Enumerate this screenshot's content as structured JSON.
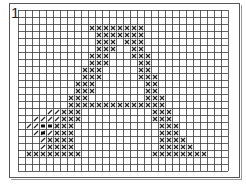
{
  "pattern": {
    "number_label": "1",
    "title": "Cross-stitch chart: letter A",
    "grid": {
      "cols": 30,
      "rows": 23,
      "cell": 7,
      "line_color": "#3a3a3a",
      "bg": "#ffffff"
    },
    "symbols": {
      "cross": {
        "name": "cross-stitch",
        "color": "#2a2a2a"
      },
      "slash": {
        "name": "half-stitch",
        "color": "#2a2a2a"
      },
      "dot": {
        "name": "french-knot",
        "color": "#111111"
      }
    },
    "crosses": [
      [
        2,
        10
      ],
      [
        2,
        11
      ],
      [
        2,
        12
      ],
      [
        2,
        13
      ],
      [
        2,
        14
      ],
      [
        2,
        15
      ],
      [
        2,
        16
      ],
      [
        2,
        17
      ],
      [
        3,
        11
      ],
      [
        3,
        12
      ],
      [
        3,
        13
      ],
      [
        3,
        14
      ],
      [
        3,
        15
      ],
      [
        3,
        16
      ],
      [
        3,
        17
      ],
      [
        4,
        11
      ],
      [
        4,
        12
      ],
      [
        4,
        13
      ],
      [
        4,
        15
      ],
      [
        4,
        16
      ],
      [
        4,
        17
      ],
      [
        5,
        11
      ],
      [
        5,
        12
      ],
      [
        5,
        13
      ],
      [
        5,
        16
      ],
      [
        5,
        17
      ],
      [
        6,
        10
      ],
      [
        6,
        11
      ],
      [
        6,
        12
      ],
      [
        6,
        16
      ],
      [
        6,
        17
      ],
      [
        6,
        18
      ],
      [
        7,
        10
      ],
      [
        7,
        11
      ],
      [
        7,
        12
      ],
      [
        7,
        17
      ],
      [
        7,
        18
      ],
      [
        8,
        9
      ],
      [
        8,
        10
      ],
      [
        8,
        11
      ],
      [
        8,
        17
      ],
      [
        8,
        18
      ],
      [
        9,
        9
      ],
      [
        9,
        10
      ],
      [
        9,
        11
      ],
      [
        9,
        17
      ],
      [
        9,
        18
      ],
      [
        9,
        19
      ],
      [
        10,
        8
      ],
      [
        10,
        9
      ],
      [
        10,
        10
      ],
      [
        10,
        18
      ],
      [
        10,
        19
      ],
      [
        11,
        8
      ],
      [
        11,
        9
      ],
      [
        11,
        10
      ],
      [
        11,
        18
      ],
      [
        11,
        19
      ],
      [
        12,
        7
      ],
      [
        12,
        8
      ],
      [
        12,
        9
      ],
      [
        12,
        18
      ],
      [
        12,
        19
      ],
      [
        12,
        20
      ],
      [
        13,
        7
      ],
      [
        13,
        8
      ],
      [
        13,
        9
      ],
      [
        13,
        10
      ],
      [
        13,
        11
      ],
      [
        13,
        12
      ],
      [
        13,
        13
      ],
      [
        13,
        14
      ],
      [
        13,
        15
      ],
      [
        13,
        16
      ],
      [
        13,
        17
      ],
      [
        13,
        18
      ],
      [
        13,
        19
      ],
      [
        13,
        20
      ],
      [
        14,
        6
      ],
      [
        14,
        7
      ],
      [
        14,
        8
      ],
      [
        14,
        19
      ],
      [
        14,
        20
      ],
      [
        14,
        21
      ],
      [
        15,
        6
      ],
      [
        15,
        7
      ],
      [
        15,
        8
      ],
      [
        15,
        19
      ],
      [
        15,
        20
      ],
      [
        15,
        21
      ],
      [
        16,
        5
      ],
      [
        16,
        6
      ],
      [
        16,
        7
      ],
      [
        16,
        20
      ],
      [
        16,
        21
      ],
      [
        16,
        22
      ],
      [
        17,
        5
      ],
      [
        17,
        6
      ],
      [
        17,
        7
      ],
      [
        17,
        20
      ],
      [
        17,
        21
      ],
      [
        17,
        22
      ],
      [
        18,
        4
      ],
      [
        18,
        5
      ],
      [
        18,
        6
      ],
      [
        18,
        7
      ],
      [
        18,
        20
      ],
      [
        18,
        21
      ],
      [
        18,
        22
      ],
      [
        18,
        23
      ],
      [
        19,
        4
      ],
      [
        19,
        5
      ],
      [
        19,
        6
      ],
      [
        19,
        7
      ],
      [
        19,
        20
      ],
      [
        19,
        21
      ],
      [
        19,
        22
      ],
      [
        19,
        23
      ],
      [
        19,
        24
      ],
      [
        20,
        1
      ],
      [
        20,
        2
      ],
      [
        20,
        3
      ],
      [
        20,
        4
      ],
      [
        20,
        5
      ],
      [
        20,
        6
      ],
      [
        20,
        7
      ],
      [
        20,
        8
      ],
      [
        20,
        19
      ],
      [
        20,
        20
      ],
      [
        20,
        21
      ],
      [
        20,
        22
      ],
      [
        20,
        23
      ],
      [
        20,
        24
      ],
      [
        20,
        25
      ],
      [
        20,
        26
      ]
    ],
    "slashes": [
      [
        14,
        4
      ],
      [
        14,
        5
      ],
      [
        15,
        2
      ],
      [
        15,
        3
      ],
      [
        15,
        4
      ],
      [
        15,
        5
      ],
      [
        16,
        1
      ],
      [
        16,
        2
      ],
      [
        16,
        5
      ],
      [
        17,
        2
      ],
      [
        17,
        3
      ],
      [
        17,
        4
      ],
      [
        18,
        3
      ],
      [
        19,
        3
      ]
    ],
    "dots": [
      [
        16,
        3
      ],
      [
        16,
        4
      ],
      [
        17,
        3
      ]
    ]
  }
}
